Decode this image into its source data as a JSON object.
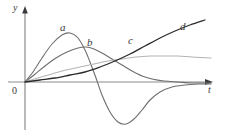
{
  "figure": {
    "name": "response-curves-figure",
    "background": "#ffffff",
    "width": 225,
    "height": 134
  },
  "axes": {
    "y_label": "y",
    "t_label": "t",
    "origin_label": "0",
    "axis_color": "#8c8c8c",
    "origin_px": {
      "x": 25,
      "y": 82
    },
    "y_axis_top_px": 10,
    "t_axis_right_px": 213
  },
  "chart_data": {
    "type": "line",
    "title": "",
    "xlabel": "t",
    "ylabel": "y",
    "grid": false,
    "legend": "inline-curve-labels",
    "xlim": [
      0,
      10
    ],
    "ylim": [
      -2.6,
      3.4
    ],
    "series": [
      {
        "name": "a",
        "label": "a",
        "color": "#6e6e6e",
        "width": 1.1,
        "label_px": {
          "x": 60,
          "y": 22
        },
        "description": "rises to an early positive peak, falls steeply through zero into a deep negative trough, then recovers asymptotically toward zero",
        "points_px": [
          [
            25,
            82
          ],
          [
            33,
            72
          ],
          [
            42,
            58
          ],
          [
            52,
            44
          ],
          [
            62,
            35
          ],
          [
            70,
            33
          ],
          [
            78,
            38
          ],
          [
            85,
            50
          ],
          [
            90,
            62
          ],
          [
            96,
            78
          ],
          [
            102,
            95
          ],
          [
            110,
            112
          ],
          [
            118,
            122
          ],
          [
            126,
            124
          ],
          [
            134,
            119
          ],
          [
            142,
            110
          ],
          [
            150,
            100
          ],
          [
            160,
            92
          ],
          [
            172,
            87
          ],
          [
            185,
            85
          ],
          [
            198,
            84
          ],
          [
            211,
            84
          ]
        ],
        "data": {
          "x": [
            0,
            0.4,
            0.9,
            1.4,
            1.9,
            2.3,
            2.7,
            3.1,
            3.4,
            3.7,
            4.1,
            4.6,
            5.1,
            5.5,
            6.0,
            6.4,
            6.9,
            7.4,
            8.1,
            8.8,
            9.4,
            10.0
          ],
          "y": [
            0,
            0.45,
            1.1,
            1.7,
            2.1,
            2.2,
            2.0,
            1.4,
            0.9,
            0.2,
            -0.6,
            -1.4,
            -1.8,
            -1.9,
            -1.7,
            -1.3,
            -0.8,
            -0.45,
            -0.22,
            -0.13,
            -0.09,
            -0.09
          ]
        }
      },
      {
        "name": "b",
        "label": "b",
        "color": "#6e6e6e",
        "width": 1.1,
        "label_px": {
          "x": 87,
          "y": 37
        },
        "description": "rises more slowly to a later, lower peak then decays monotonically toward zero from above",
        "points_px": [
          [
            25,
            82
          ],
          [
            34,
            75
          ],
          [
            45,
            66
          ],
          [
            56,
            58
          ],
          [
            67,
            52
          ],
          [
            78,
            48
          ],
          [
            86,
            47
          ],
          [
            94,
            49
          ],
          [
            102,
            53
          ],
          [
            112,
            59
          ],
          [
            122,
            65
          ],
          [
            132,
            71
          ],
          [
            142,
            76
          ],
          [
            152,
            79
          ],
          [
            164,
            81
          ],
          [
            178,
            82
          ],
          [
            192,
            83
          ],
          [
            211,
            83
          ]
        ],
        "data": {
          "x": [
            0,
            0.5,
            1.1,
            1.7,
            2.3,
            2.9,
            3.3,
            3.8,
            4.2,
            4.8,
            5.4,
            5.9,
            6.5,
            7.0,
            7.6,
            8.4,
            9.1,
            10.0
          ],
          "y": [
            0,
            0.3,
            0.7,
            1.05,
            1.3,
            1.5,
            1.55,
            1.45,
            1.3,
            1.0,
            0.75,
            0.5,
            0.3,
            0.15,
            0.05,
            0.0,
            -0.05,
            -0.05
          ]
        }
      },
      {
        "name": "c",
        "label": "c",
        "color": "#b4b4b4",
        "width": 1.1,
        "label_px": {
          "x": 128,
          "y": 35
        },
        "description": "light gray, slow saturating rise to a broad shallow plateau near the right edge",
        "points_px": [
          [
            25,
            82
          ],
          [
            38,
            78
          ],
          [
            52,
            74
          ],
          [
            66,
            70
          ],
          [
            80,
            67
          ],
          [
            94,
            64
          ],
          [
            108,
            61
          ],
          [
            122,
            59
          ],
          [
            136,
            57
          ],
          [
            150,
            56
          ],
          [
            164,
            56
          ],
          [
            178,
            56
          ],
          [
            192,
            57
          ],
          [
            211,
            58
          ]
        ],
        "data": {
          "x": [
            0,
            0.7,
            1.4,
            2.1,
            2.8,
            3.5,
            4.2,
            4.9,
            5.6,
            6.3,
            7.0,
            7.7,
            8.4,
            10.0
          ],
          "y": [
            0,
            0.2,
            0.4,
            0.6,
            0.75,
            0.9,
            1.05,
            1.15,
            1.25,
            1.3,
            1.3,
            1.3,
            1.25,
            1.2
          ]
        }
      },
      {
        "name": "d",
        "label": "d",
        "color": "#2b2b2b",
        "width": 1.3,
        "label_px": {
          "x": 180,
          "y": 21
        },
        "description": "dark, slowly accelerating monotone rise that overtakes all other curves on the right",
        "points_px": [
          [
            25,
            82
          ],
          [
            40,
            80
          ],
          [
            55,
            78
          ],
          [
            70,
            75
          ],
          [
            85,
            72
          ],
          [
            100,
            67
          ],
          [
            115,
            61
          ],
          [
            130,
            54
          ],
          [
            145,
            46
          ],
          [
            160,
            38
          ],
          [
            175,
            31
          ],
          [
            190,
            25
          ],
          [
            205,
            20
          ]
        ],
        "data": {
          "x": [
            0,
            0.75,
            1.5,
            2.25,
            3.0,
            3.75,
            4.5,
            5.25,
            6.0,
            6.75,
            7.5,
            8.25,
            9.0
          ],
          "y": [
            0,
            0.1,
            0.2,
            0.35,
            0.5,
            0.75,
            1.05,
            1.4,
            1.8,
            2.2,
            2.55,
            2.85,
            3.1
          ]
        }
      }
    ]
  }
}
